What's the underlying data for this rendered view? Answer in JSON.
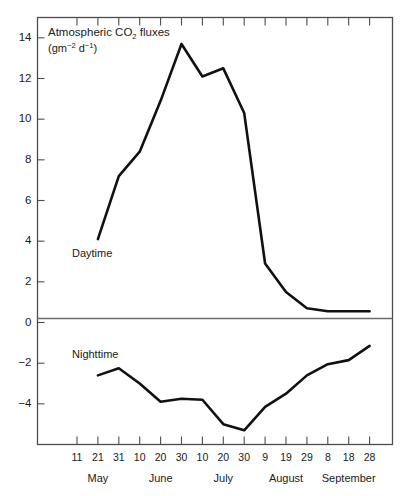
{
  "chart_data": {
    "type": "line",
    "title": "Atmospheric CO2 fluxes",
    "title_parts": {
      "before": "Atmospheric CO",
      "subscript": "2",
      "after": " fluxes"
    },
    "units_parts": {
      "a": "(gm",
      "sup1": "−2",
      "b": " d",
      "sup2": "−1",
      "c": ")"
    },
    "ylabel": "Atmospheric CO2 fluxes (gm-2 d-1)",
    "xlabel": "",
    "ylim": [
      -6,
      15
    ],
    "grid": false,
    "legend_position": "inline-annotation",
    "y_ticks": [
      14,
      12,
      10,
      8,
      6,
      4,
      2,
      0,
      -2,
      -4
    ],
    "y_tick_labels": [
      "14",
      "12",
      "10",
      "8",
      "6",
      "4",
      "2",
      "0",
      "−2",
      "−4"
    ],
    "x_tick_labels": [
      "11",
      "21",
      "31",
      "10",
      "20",
      "30",
      "10",
      "20",
      "30",
      "9",
      "19",
      "29",
      "8",
      "18",
      "28"
    ],
    "month_labels": [
      "May",
      "June",
      "July",
      "August",
      "September"
    ],
    "month_centers": [
      "21",
      "20",
      "20",
      "19",
      "18"
    ],
    "series": [
      {
        "name": "Daytime",
        "annotation": "Daytime",
        "x": [
          "21",
          "31",
          "10",
          "20",
          "30",
          "10",
          "20",
          "30",
          "9",
          "19",
          "29",
          "8",
          "18",
          "28"
        ],
        "values": [
          4.1,
          7.2,
          8.4,
          10.9,
          13.7,
          12.1,
          12.5,
          10.3,
          2.9,
          1.5,
          0.7,
          0.55,
          0.55,
          0.55
        ]
      },
      {
        "name": "Nighttime",
        "annotation": "Nighttime",
        "x": [
          "21",
          "31",
          "10",
          "20",
          "30",
          "10",
          "20",
          "30",
          "9",
          "19",
          "29",
          "8",
          "18",
          "28"
        ],
        "values": [
          -2.6,
          -2.25,
          -3.0,
          -3.9,
          -3.75,
          -3.8,
          -5.0,
          -5.3,
          -4.15,
          -3.5,
          -2.6,
          -2.05,
          -1.85,
          -1.15
        ]
      }
    ]
  },
  "colors": {
    "series_stroke": "#111111",
    "axis": "#4d4d4d",
    "background": "#ffffff"
  }
}
